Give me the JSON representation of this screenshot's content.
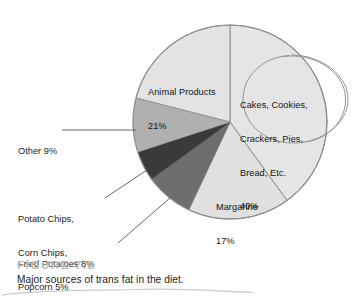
{
  "figure": {
    "number_label": "FIGURE 7.2",
    "caption": "Major sources of trans fat in the diet."
  },
  "chart_data": {
    "type": "pie",
    "title": "Major sources of trans fat in the diet.",
    "xlabel": "",
    "ylabel": "",
    "unit": "percent",
    "total": 100,
    "legend_position": "none",
    "grid": false,
    "labels_inside": [
      "Cakes, Cookies, Crackers, Pies, Bread, Etc.",
      "Animal Products",
      "Margarine"
    ],
    "labels_outside": [
      "Other",
      "Potato Chips, Corn Chips, Popcorn",
      "Fried Potatoes"
    ],
    "categories": [
      "Cakes, Cookies, Crackers, Pies, Bread, Etc.",
      "Margarine",
      "Fried Potatoes",
      "Potato Chips, Corn Chips, Popcorn",
      "Other",
      "Animal Products"
    ],
    "values": [
      40,
      17,
      8,
      5,
      9,
      21
    ],
    "colors": [
      "#e5e5e5",
      "#e0e0e0",
      "#6e6e6e",
      "#3a3a3a",
      "#b0b0b0",
      "#e3e3e3"
    ],
    "slices": [
      {
        "name": "Cakes, Cookies, Crackers, Pies, Bread, Etc.",
        "value": 40,
        "value_label": "40%",
        "color": "#e5e5e5",
        "start_deg": 0,
        "end_deg": 144
      },
      {
        "name": "Margarine",
        "value": 17,
        "value_label": "17%",
        "color": "#e0e0e0",
        "start_deg": 144,
        "end_deg": 205.2
      },
      {
        "name": "Fried Potatoes",
        "value": 8,
        "value_label": "8%",
        "color": "#6e6e6e",
        "start_deg": 205.2,
        "end_deg": 234
      },
      {
        "name": "Potato Chips, Corn Chips, Popcorn",
        "value": 5,
        "value_label": "5%",
        "color": "#3a3a3a",
        "start_deg": 234,
        "end_deg": 252
      },
      {
        "name": "Other",
        "value": 9,
        "value_label": "9%",
        "color": "#b0b0b0",
        "start_deg": 252,
        "end_deg": 284.4
      },
      {
        "name": "Animal Products",
        "value": 21,
        "value_label": "21%",
        "color": "#e3e3e3",
        "start_deg": 284.4,
        "end_deg": 360
      }
    ]
  },
  "slice_labels": {
    "cakes": {
      "line1": "Cakes, Cookies,",
      "line2": "Crackers, Pies,",
      "line3": "Bread, Etc.",
      "line4": "40%"
    },
    "animal_products": {
      "line1": "Animal Products",
      "line2": "21%"
    },
    "margarine": {
      "line1": "Margarine",
      "line2": "17%"
    },
    "other": {
      "line1": "Other 9%"
    },
    "potato_chips": {
      "line1": "Potato Chips,",
      "line2": "Corn Chips,",
      "line3": "Popcorn 5%"
    },
    "fried_potatoes": {
      "line1": "Fried Potatoes 8%"
    }
  },
  "annotation": {
    "kind": "hand-drawn-circle",
    "encircles": "Cakes, Cookies, Crackers, Pies, Bread, Etc. 40%"
  },
  "colors": {
    "pie_outline": "#8c8c8c",
    "label_text": "#1a1a1a",
    "figure_number": "#bdbdbd",
    "caption": "#232323",
    "leader_line": "#555555",
    "annotation_stroke": "#8f8f8f",
    "scan_artifact": "#c9c9c9"
  }
}
